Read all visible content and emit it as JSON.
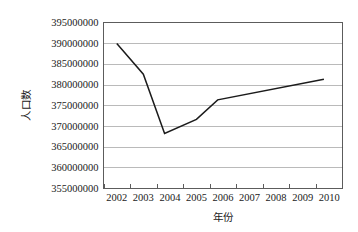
{
  "chart_data": {
    "type": "line",
    "title": "",
    "xlabel": "年份",
    "ylabel": "人口数",
    "grid": true,
    "legend": "none",
    "xlim": [
      2001.5,
      2010.5
    ],
    "ylim": [
      355000000,
      395000000
    ],
    "y_tick_step": 5000000,
    "categories": [
      "2002",
      "2003",
      "2004",
      "2005",
      "2006",
      "2007",
      "2008",
      "2009",
      "2010"
    ],
    "y_tick_labels": [
      "395000000",
      "390000000",
      "385000000",
      "380000000",
      "375000000",
      "370000000",
      "365000000",
      "360000000",
      "355000000"
    ],
    "series": [
      {
        "name": "人口数",
        "points": [
          {
            "x": 2002.0,
            "y": 389900000
          },
          {
            "x": 2003.0,
            "y": 382500000
          },
          {
            "x": 2003.8,
            "y": 368200000
          },
          {
            "x": 2005.0,
            "y": 371600000
          },
          {
            "x": 2005.8,
            "y": 376300000
          },
          {
            "x": 2009.8,
            "y": 381300000
          }
        ]
      }
    ]
  },
  "axes": {
    "y_axis_name": "y-axis",
    "x_axis_name": "x-axis"
  }
}
